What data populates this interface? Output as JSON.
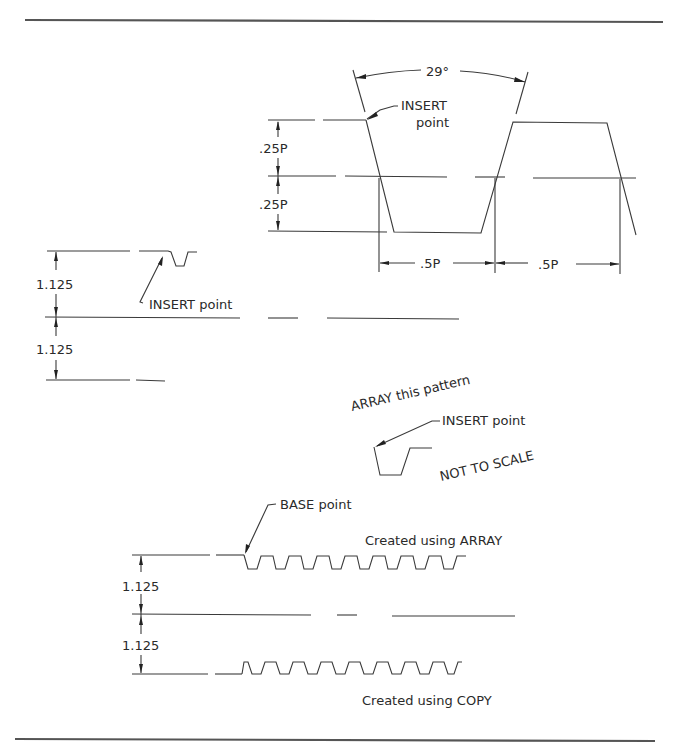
{
  "figure": {
    "type": "engineering-drawing"
  },
  "thread_detail": {
    "angle_label": "29°",
    "insert_label_line1": "INSERT",
    "insert_label_line2": "point",
    "height_dims": [
      ".25P",
      ".25P"
    ],
    "pitch_dims": [
      ".5P",
      ".5P"
    ]
  },
  "insert_example": {
    "height_dims": [
      "1.125",
      "1.125"
    ],
    "insert_label": "INSERT point"
  },
  "array_pattern": {
    "title": "ARRAY this pattern",
    "insert_label": "INSERT point",
    "scale_note": "NOT TO SCALE"
  },
  "result_example": {
    "base_label": "BASE point",
    "array_caption": "Created using ARRAY",
    "copy_caption": "Created using COPY",
    "height_dims": [
      "1.125",
      "1.125"
    ],
    "tooth_count": 8
  },
  "colors": {
    "line": "#3a3a3a",
    "border": "#555555",
    "text": "#2a2a2a",
    "background": "#ffffff"
  }
}
